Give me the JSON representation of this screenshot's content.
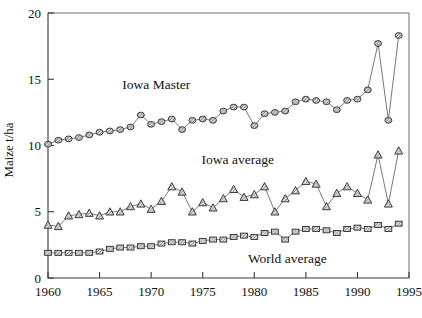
{
  "chart_data": {
    "type": "line",
    "title": "",
    "xlabel": "",
    "ylabel": "Maize t/ha",
    "xlim": [
      1960,
      1995
    ],
    "ylim": [
      0,
      20
    ],
    "xticks": [
      1960,
      1965,
      1970,
      1975,
      1980,
      1985,
      1990,
      1995
    ],
    "yticks": [
      0,
      5,
      10,
      15,
      20
    ],
    "grid": false,
    "legend_position": "inline-annotations",
    "x": [
      1960,
      1961,
      1962,
      1963,
      1964,
      1965,
      1966,
      1967,
      1968,
      1969,
      1970,
      1971,
      1972,
      1973,
      1974,
      1975,
      1976,
      1977,
      1978,
      1979,
      1980,
      1981,
      1982,
      1983,
      1984,
      1985,
      1986,
      1987,
      1988,
      1989,
      1990,
      1991,
      1992,
      1993,
      1994
    ],
    "series": [
      {
        "name": "Iowa Master",
        "marker": "circle",
        "values": [
          10.1,
          10.4,
          10.5,
          10.6,
          10.8,
          11.0,
          11.1,
          11.2,
          11.4,
          12.3,
          11.6,
          11.8,
          12.0,
          11.2,
          11.9,
          12.0,
          11.9,
          12.6,
          12.9,
          12.9,
          11.5,
          12.4,
          12.5,
          12.6,
          13.3,
          13.5,
          13.4,
          13.3,
          12.7,
          13.4,
          13.5,
          14.2,
          17.7,
          11.9,
          18.3
        ]
      },
      {
        "name": "Iowa average",
        "marker": "triangle",
        "values": [
          4.0,
          3.9,
          4.7,
          4.8,
          4.9,
          4.7,
          5.0,
          5.0,
          5.4,
          5.6,
          5.2,
          5.8,
          6.9,
          6.5,
          5.0,
          5.7,
          5.3,
          6.0,
          6.7,
          6.1,
          6.3,
          6.9,
          5.0,
          6.0,
          6.6,
          7.3,
          7.1,
          5.4,
          6.4,
          6.9,
          6.4,
          5.9,
          9.3,
          5.6,
          9.6
        ]
      },
      {
        "name": "World average",
        "marker": "square",
        "values": [
          1.9,
          1.9,
          1.9,
          1.9,
          1.9,
          2.0,
          2.2,
          2.3,
          2.3,
          2.4,
          2.4,
          2.6,
          2.7,
          2.7,
          2.6,
          2.8,
          2.9,
          2.9,
          3.1,
          3.2,
          3.1,
          3.4,
          3.5,
          2.9,
          3.5,
          3.7,
          3.7,
          3.6,
          3.4,
          3.7,
          3.8,
          3.7,
          4.0,
          3.7,
          4.1
        ]
      }
    ],
    "annotations": [
      {
        "text": "Iowa Master",
        "x": 1970.5,
        "y": 14.3
      },
      {
        "text": "Iowa average",
        "x": 1978.4,
        "y": 8.6
      },
      {
        "text": "World average",
        "x": 1983.2,
        "y": 1.15
      }
    ]
  }
}
